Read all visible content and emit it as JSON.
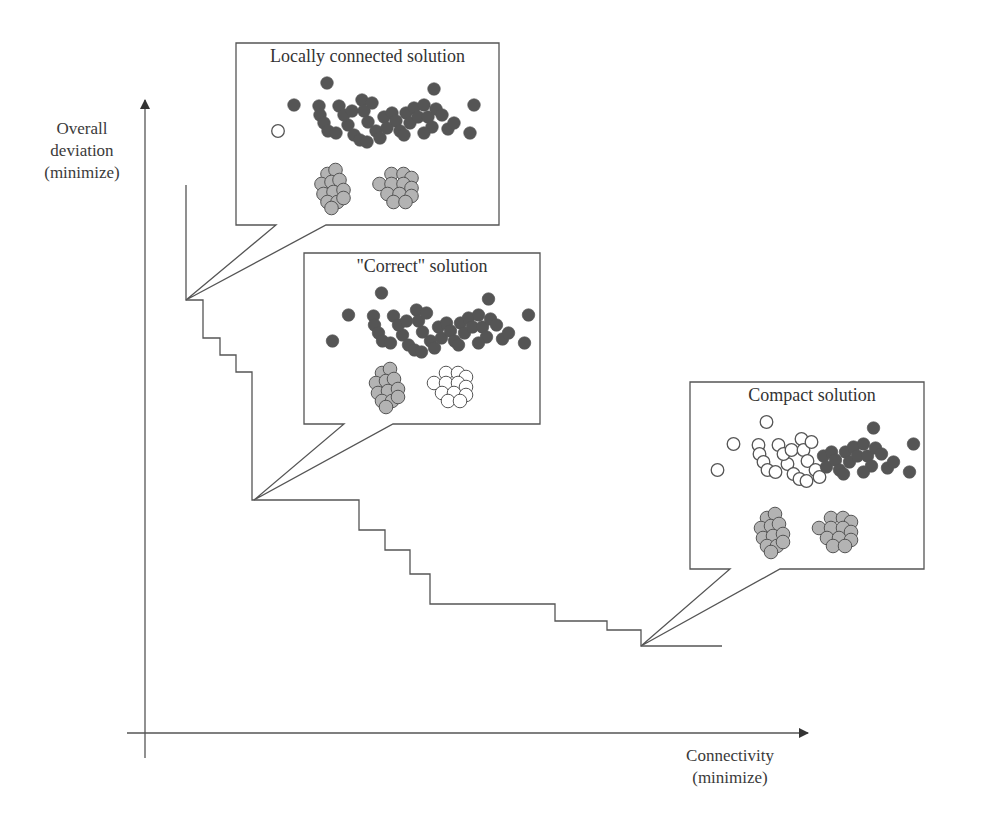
{
  "axes": {
    "y_label_lines": [
      "Overall",
      "deviation",
      "(minimize)"
    ],
    "x_label_lines": [
      "Connectivity",
      "(minimize)"
    ]
  },
  "colors": {
    "line": "#555555",
    "dark_point": "#555555",
    "light_point": "#b3b3b3",
    "open_point": "#ffffff",
    "point_stroke": "#555555"
  },
  "callouts": [
    {
      "id": "locally-connected",
      "title": "Locally connected solution",
      "box": [
        236,
        43,
        263,
        182
      ],
      "tail_gap": [
        276,
        326
      ],
      "anchor": [
        186,
        300
      ],
      "cluster_colors": {
        "big_cloud": "all-dark-except-one-open",
        "small_left": "gray",
        "small_right": "gray"
      }
    },
    {
      "id": "correct",
      "title": "\"Correct\" solution",
      "box": [
        304,
        253,
        236,
        171
      ],
      "tail_gap": [
        344,
        393
      ],
      "anchor": [
        254,
        500
      ],
      "cluster_colors": {
        "big_cloud": "dark",
        "small_left": "gray",
        "small_right": "open"
      }
    },
    {
      "id": "compact",
      "title": "Compact solution",
      "box": [
        690,
        382,
        234,
        187
      ],
      "tail_gap": [
        730,
        780
      ],
      "anchor": [
        641,
        646
      ],
      "cluster_colors": {
        "big_cloud": "left-open-right-dark",
        "small_left": "gray",
        "small_right": "gray"
      }
    }
  ],
  "chart_data": {
    "type": "line",
    "title": "",
    "xlabel": "Connectivity (minimize)",
    "ylabel": "Overall deviation (minimize)",
    "step_front_pixels": [
      [
        186,
        185
      ],
      [
        186,
        300
      ],
      [
        203,
        300
      ],
      [
        203,
        338
      ],
      [
        220,
        338
      ],
      [
        220,
        355
      ],
      [
        236,
        355
      ],
      [
        236,
        372
      ],
      [
        252,
        372
      ],
      [
        252,
        500
      ],
      [
        359,
        500
      ],
      [
        359,
        530
      ],
      [
        385,
        530
      ],
      [
        385,
        550
      ],
      [
        410,
        550
      ],
      [
        410,
        574
      ],
      [
        430,
        574
      ],
      [
        430,
        604
      ],
      [
        555,
        604
      ],
      [
        555,
        621
      ],
      [
        607,
        621
      ],
      [
        607,
        630
      ],
      [
        641,
        630
      ],
      [
        641,
        646
      ],
      [
        722,
        646
      ]
    ],
    "highlighted_solutions": [
      {
        "label": "Locally connected solution",
        "point_px": [
          186,
          300
        ],
        "position": "high deviation, low connectivity"
      },
      {
        "label": "\"Correct\" solution",
        "point_px": [
          254,
          500
        ],
        "position": "knee of front"
      },
      {
        "label": "Compact solution",
        "point_px": [
          641,
          646
        ],
        "position": "low deviation, high connectivity"
      }
    ],
    "grid": false,
    "legend": null
  }
}
